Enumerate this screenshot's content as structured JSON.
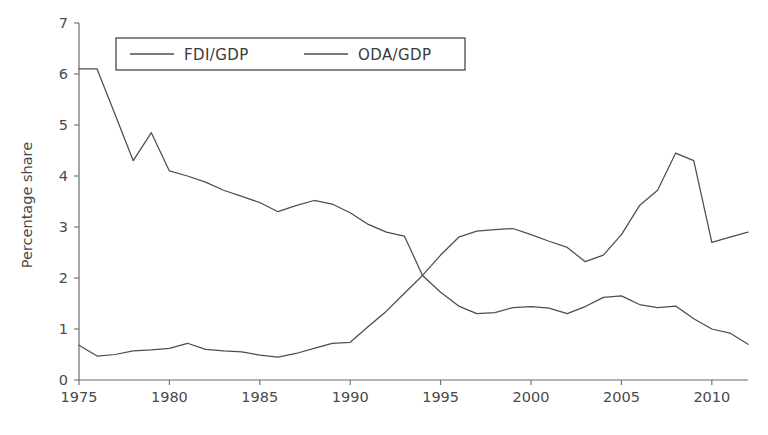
{
  "chart_data": {
    "type": "line",
    "title": "",
    "xlabel": "",
    "ylabel": "Percentage share",
    "xlim": [
      1975,
      2012
    ],
    "ylim": [
      0,
      7
    ],
    "ytick_labels": [
      "0",
      "1",
      "2",
      "3",
      "4",
      "5",
      "6",
      "7"
    ],
    "ytick_values": [
      0,
      1,
      2,
      3,
      4,
      5,
      6,
      7
    ],
    "xtick_labels": [
      "1975",
      "1980",
      "1985",
      "1990",
      "1995",
      "2000",
      "2005",
      "2010"
    ],
    "xtick_values": [
      1975,
      1980,
      1985,
      1990,
      1995,
      2000,
      2005,
      2010
    ],
    "grid": false,
    "legend_position": "top-center",
    "x": [
      1975,
      1976,
      1977,
      1978,
      1979,
      1980,
      1981,
      1982,
      1983,
      1984,
      1985,
      1986,
      1987,
      1988,
      1989,
      1990,
      1991,
      1992,
      1993,
      1994,
      1995,
      1996,
      1997,
      1998,
      1999,
      2000,
      2001,
      2002,
      2003,
      2004,
      2005,
      2006,
      2007,
      2008,
      2009,
      2010,
      2011,
      2012
    ],
    "series": [
      {
        "name": "FDI/GDP",
        "values": [
          0.68,
          0.47,
          0.5,
          0.57,
          0.59,
          0.62,
          0.72,
          0.6,
          0.57,
          0.55,
          0.49,
          0.45,
          0.52,
          0.62,
          0.72,
          0.74,
          1.05,
          1.35,
          1.7,
          2.05,
          2.45,
          2.8,
          2.92,
          2.95,
          2.97,
          2.85,
          2.72,
          2.6,
          2.32,
          2.45,
          2.85,
          3.42,
          3.72,
          4.45,
          4.3,
          2.7,
          2.8,
          2.9
        ]
      },
      {
        "name": "ODA/GDP",
        "values": [
          6.1,
          6.1,
          5.2,
          4.3,
          4.85,
          4.1,
          4.0,
          3.88,
          3.72,
          3.6,
          3.48,
          3.3,
          3.42,
          3.52,
          3.45,
          3.28,
          3.05,
          2.9,
          2.82,
          2.05,
          1.72,
          1.45,
          1.3,
          1.32,
          1.42,
          1.44,
          1.41,
          1.3,
          1.44,
          1.62,
          1.65,
          1.48,
          1.42,
          1.45,
          1.2,
          1.0,
          0.92,
          0.7
        ]
      }
    ],
    "legend": [
      {
        "label": "FDI/GDP"
      },
      {
        "label": "ODA/GDP"
      }
    ],
    "colors": {
      "series": "#4d4d4d",
      "axis": "#6b6b6b",
      "text": "#4a4a4a",
      "background": "#ffffff"
    }
  }
}
